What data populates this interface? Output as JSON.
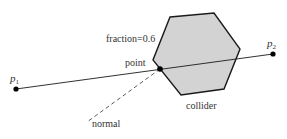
{
  "diagram": {
    "colors": {
      "stroke": "#1a1a1a",
      "collider_fill": "#d3d3d3",
      "text": "#333333",
      "background": "#ffffff"
    },
    "collider": {
      "label": "collider",
      "vertices": [
        [
          170,
          17
        ],
        [
          214,
          13
        ],
        [
          240,
          49
        ],
        [
          224,
          89
        ],
        [
          181,
          95
        ],
        [
          153,
          60
        ]
      ]
    },
    "ray": {
      "start": {
        "name": "p",
        "sub": "1",
        "x": 16,
        "y": 89
      },
      "end": {
        "name": "p",
        "sub": "2",
        "x": 273,
        "y": 54
      }
    },
    "hit": {
      "point_label": "point",
      "fraction_label": "fraction=0.6",
      "x": 160,
      "y": 69
    },
    "normal": {
      "label": "normal",
      "from": [
        160,
        69
      ],
      "to": [
        87,
        122
      ],
      "style": "dashed"
    }
  }
}
